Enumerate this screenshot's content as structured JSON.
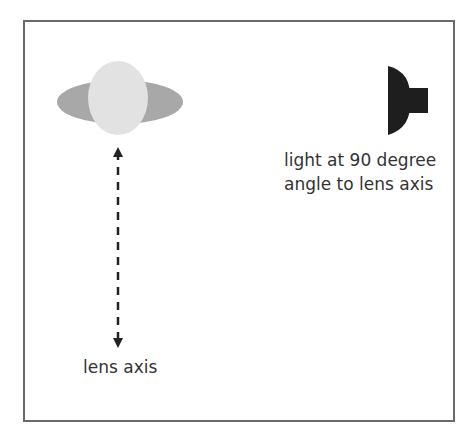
{
  "diagram": {
    "labels": {
      "light": [
        "light at 90 degree",
        "angle to lens axis"
      ],
      "lens_axis": "lens axis"
    },
    "colors": {
      "frame": "#6a6a6a",
      "lens_outer": "#a8a8a8",
      "lens_inner": "#e2e2e2",
      "light_source": "#1e1e1e",
      "arrow": "#222222",
      "text": "#333333"
    },
    "elements": [
      "lens",
      "light-source",
      "lens-axis-arrow"
    ]
  }
}
